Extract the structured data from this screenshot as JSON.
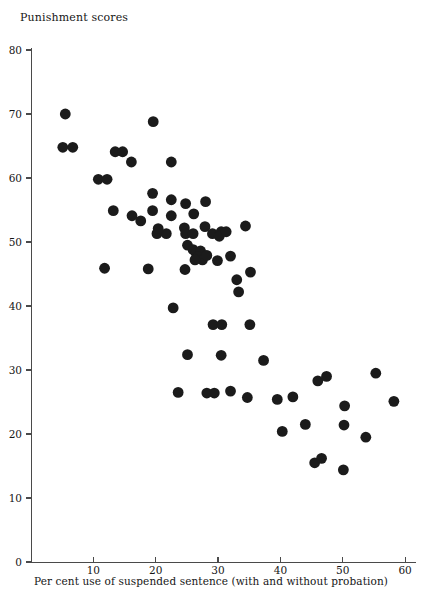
{
  "chart_data": {
    "type": "scatter",
    "title": "",
    "ylabel": "Punishment scores",
    "xlabel": "Per cent use of suspended sentence (with and without probation)",
    "xlim": [
      0,
      62
    ],
    "ylim": [
      0,
      82
    ],
    "xticks": [
      10,
      20,
      30,
      40,
      50,
      60
    ],
    "yticks": [
      0,
      10,
      20,
      30,
      40,
      50,
      60,
      70,
      80
    ],
    "grid": false,
    "legend": null,
    "marker": {
      "shape": "circle",
      "color": "#1b1b1b",
      "size": 5.4
    },
    "n_points": 74,
    "points": [
      [
        5.5,
        70.0
      ],
      [
        5.1,
        64.8
      ],
      [
        6.7,
        64.8
      ],
      [
        10.8,
        59.8
      ],
      [
        12.2,
        59.8
      ],
      [
        13.5,
        64.1
      ],
      [
        14.7,
        64.1
      ],
      [
        16.1,
        62.5
      ],
      [
        19.6,
        68.8
      ],
      [
        22.5,
        62.5
      ],
      [
        19.5,
        57.6
      ],
      [
        13.2,
        54.9
      ],
      [
        16.2,
        54.1
      ],
      [
        17.6,
        53.3
      ],
      [
        19.5,
        54.9
      ],
      [
        22.5,
        56.6
      ],
      [
        22.5,
        54.1
      ],
      [
        24.6,
        52.2
      ],
      [
        24.8,
        51.3
      ],
      [
        26.0,
        51.3
      ],
      [
        20.2,
        51.3
      ],
      [
        21.7,
        51.3
      ],
      [
        20.4,
        52.1
      ],
      [
        24.8,
        56.0
      ],
      [
        26.1,
        54.4
      ],
      [
        28.0,
        56.3
      ],
      [
        27.9,
        52.4
      ],
      [
        29.1,
        51.3
      ],
      [
        30.5,
        51.6
      ],
      [
        30.2,
        50.9
      ],
      [
        25.1,
        49.5
      ],
      [
        26.0,
        48.8
      ],
      [
        26.5,
        48.3
      ],
      [
        27.2,
        48.6
      ],
      [
        26.8,
        47.7
      ],
      [
        27.5,
        47.2
      ],
      [
        26.3,
        47.2
      ],
      [
        28.2,
        47.9
      ],
      [
        11.8,
        45.9
      ],
      [
        18.8,
        45.8
      ],
      [
        24.7,
        45.7
      ],
      [
        29.9,
        47.1
      ],
      [
        31.3,
        51.6
      ],
      [
        32.0,
        47.8
      ],
      [
        33.0,
        44.1
      ],
      [
        34.4,
        52.5
      ],
      [
        35.2,
        45.3
      ],
      [
        33.3,
        42.2
      ],
      [
        22.8,
        39.7
      ],
      [
        29.2,
        37.1
      ],
      [
        30.6,
        37.1
      ],
      [
        35.1,
        37.1
      ],
      [
        25.1,
        32.4
      ],
      [
        30.5,
        32.3
      ],
      [
        37.3,
        31.5
      ],
      [
        23.6,
        26.5
      ],
      [
        28.2,
        26.4
      ],
      [
        29.4,
        26.4
      ],
      [
        32.0,
        26.7
      ],
      [
        34.7,
        25.7
      ],
      [
        39.5,
        25.4
      ],
      [
        42.0,
        25.8
      ],
      [
        46.0,
        28.3
      ],
      [
        47.4,
        29.0
      ],
      [
        50.3,
        24.4
      ],
      [
        55.3,
        29.5
      ],
      [
        58.2,
        25.1
      ],
      [
        40.3,
        20.4
      ],
      [
        44.0,
        21.5
      ],
      [
        50.2,
        21.4
      ],
      [
        45.5,
        15.5
      ],
      [
        46.6,
        16.2
      ],
      [
        50.1,
        14.4
      ],
      [
        53.7,
        19.5
      ]
    ]
  }
}
